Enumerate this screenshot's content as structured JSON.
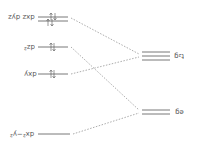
{
  "diagram": {
    "title": "",
    "orientation": "rotated-180",
    "colors": {
      "line": "#555555",
      "dashed": "#888888",
      "text": "#555555",
      "background": "#ffffff"
    },
    "left_levels": [
      {
        "id": "dxz-dyz",
        "label": "dxz dyz",
        "y": 16,
        "lines": [
          16,
          21
        ],
        "electrons": [
          "↑↓",
          "↑↓"
        ]
      },
      {
        "id": "dz2",
        "label": "dz²",
        "y": 46,
        "lines": [
          46
        ],
        "electrons": [
          "↑↓"
        ]
      },
      {
        "id": "dxy",
        "label": "dxy",
        "y": 73,
        "lines": [
          73
        ],
        "electrons": [
          "↑↓"
        ]
      },
      {
        "id": "dx2-y2",
        "label": "dx²−y²",
        "y": 133,
        "lines": [
          133
        ],
        "electrons": []
      }
    ],
    "right_levels": [
      {
        "id": "t2g",
        "label": "t₂g",
        "lines": [
          52,
          56,
          60
        ]
      },
      {
        "id": "eg",
        "label": "eg",
        "lines": [
          110,
          114
        ]
      }
    ]
  }
}
